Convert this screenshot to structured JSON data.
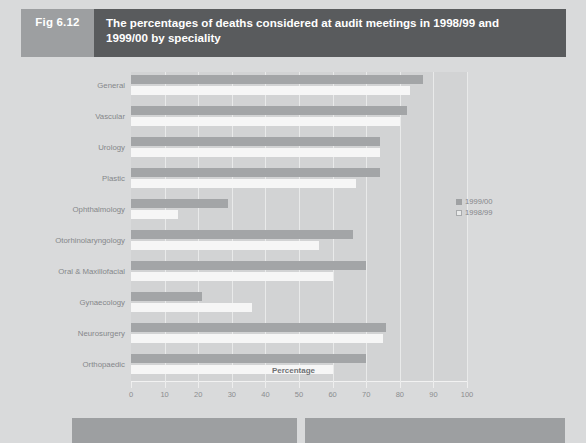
{
  "figure": {
    "tag": "Fig 6.12",
    "title_line1": "The percentages of deaths considered at audit meetings in 1998/99 and",
    "title_line2": "1999/00 by speciality"
  },
  "legend": {
    "position": "right",
    "items": [
      {
        "label": "1999/00",
        "swatch": "filled-square-icon",
        "color": "#a3a5a7"
      },
      {
        "label": "1998/99",
        "swatch": "open-square-icon",
        "color": "#f6f6f6"
      }
    ]
  },
  "colors": {
    "header_tag_bg": "#9d9fa1",
    "header_title_bg": "#595b5d",
    "page_bg": "#d9dadb",
    "plot_bg": "#d2d3d4",
    "series_1999_00": "#a3a5a7",
    "series_1998_99": "#f6f6f6",
    "gridline": "#e9eaea"
  },
  "chart_data": {
    "type": "bar",
    "orientation": "horizontal",
    "title": "The percentages of deaths considered at audit meetings in 1998/99 and 1999/00 by speciality",
    "xlabel": "Percentage",
    "ylabel": "",
    "xlim": [
      0,
      100
    ],
    "xticks": [
      0,
      10,
      20,
      30,
      40,
      50,
      60,
      70,
      80,
      90,
      100
    ],
    "grid": true,
    "legend_position": "right",
    "categories": [
      "General",
      "Vascular",
      "Urology",
      "Plastic",
      "Ophthalmology",
      "Otorhinolaryngology",
      "Oral & Maxillofacial",
      "Gynaecology",
      "Neurosurgery",
      "Orthopaedic"
    ],
    "series": [
      {
        "name": "1999/00",
        "color": "#a3a5a7",
        "values": [
          87,
          82,
          74,
          74,
          29,
          66,
          70,
          21,
          76,
          70
        ]
      },
      {
        "name": "1998/99",
        "color": "#f6f6f6",
        "values": [
          83,
          80,
          74,
          67,
          14,
          56,
          60,
          36,
          75,
          60
        ]
      }
    ]
  }
}
